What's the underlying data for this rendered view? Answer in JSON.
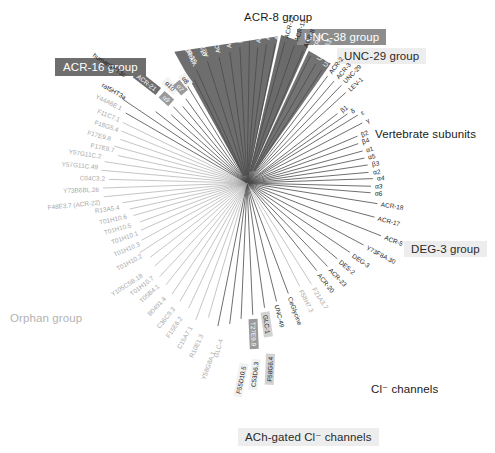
{
  "figure": {
    "type": "radial-phylogenetic-tree",
    "center": [
      247,
      183
    ]
  },
  "group_boxes": [
    {
      "name": "acr16-group",
      "label": "ACR-16 group",
      "style": "dark",
      "x": 55,
      "y": 58
    },
    {
      "name": "acr8-group",
      "label": "ACR-8 group",
      "style": "plain",
      "x": 244,
      "y": 11
    },
    {
      "name": "unc38-group",
      "label": "UNC-38 group",
      "style": "mid",
      "x": 297,
      "y": 29
    },
    {
      "name": "unc29-group",
      "label": "UNC-29 group",
      "style": "pale",
      "x": 337,
      "y": 48
    },
    {
      "name": "vertebrate-subunits",
      "label": "Vertebrate subunits",
      "style": "plain",
      "x": 375,
      "y": 128
    },
    {
      "name": "deg3-group",
      "label": "DEG-3 group",
      "style": "pale",
      "x": 404,
      "y": 241
    },
    {
      "name": "cl-channels",
      "label": "Cl⁻ channels",
      "style": "plain",
      "x": 371,
      "y": 382
    },
    {
      "name": "ach-gated-cl-channels",
      "label": "ACh-gated Cl⁻ channels",
      "style": "pale",
      "x": 238,
      "y": 428
    },
    {
      "name": "orphan-group",
      "label": "Orphan group",
      "style": "faint",
      "x": 10,
      "y": 312
    }
  ],
  "leaves": [
    {
      "text": "Y39B6BL.42",
      "angle": -114,
      "r": 128,
      "style": "white",
      "badge": "none"
    },
    {
      "text": "ACR-15",
      "angle": -108,
      "r": 132,
      "style": "white",
      "badge": "none"
    },
    {
      "text": "ACR-10",
      "angle": -102.5,
      "r": 133,
      "style": "white",
      "badge": "none"
    },
    {
      "text": "ACR-7",
      "angle": -97.5,
      "r": 136,
      "style": "white",
      "badge": "none"
    },
    {
      "text": "EAT-2",
      "angle": -93,
      "r": 140,
      "style": "white",
      "badge": "none"
    },
    {
      "text": "ACR-14",
      "angle": -89,
      "r": 146,
      "style": "white",
      "badge": "none"
    },
    {
      "text": "ACR-16",
      "angle": -85.5,
      "r": 140,
      "style": "white",
      "badge": "none"
    },
    {
      "text": "ACR-11",
      "angle": -82,
      "r": 144,
      "style": "white",
      "badge": "none"
    },
    {
      "text": "ACR-9",
      "angle": -78.5,
      "r": 146,
      "style": "white",
      "badge": "none"
    },
    {
      "text": "ACR-12",
      "angle": -75,
      "r": 150,
      "style": "dark",
      "badge": "none"
    },
    {
      "text": "ACR-13",
      "angle": -71,
      "r": 150,
      "style": "dark",
      "badge": "none"
    },
    {
      "text": "ACR-8",
      "angle": -67,
      "r": 148,
      "style": "dark",
      "badge": "none"
    },
    {
      "text": "ACR-6",
      "angle": -63.5,
      "r": 146,
      "style": "white",
      "badge": "none"
    },
    {
      "text": "UNC-63",
      "angle": -60,
      "r": 142,
      "style": "white",
      "badge": "none"
    },
    {
      "text": "UNC-38",
      "angle": -56.5,
      "r": 140,
      "style": "white",
      "badge": "none"
    },
    {
      "text": "ACR-2",
      "angle": -53,
      "r": 138,
      "style": "dark",
      "badge": "none"
    },
    {
      "text": "ACR-3",
      "angle": -49.5,
      "r": 138,
      "style": "dark",
      "badge": "none"
    },
    {
      "text": "UNC-29",
      "angle": -46,
      "r": 140,
      "style": "dark",
      "badge": "none"
    },
    {
      "text": "LEV-1",
      "angle": -42.5,
      "r": 138,
      "style": "dark",
      "badge": "none"
    },
    {
      "text": "β1",
      "angle": -37.5,
      "r": 118,
      "style": "sub",
      "badge": "none"
    },
    {
      "text": "δ",
      "angle": -34.5,
      "r": 126,
      "style": "sub",
      "badge": "none"
    },
    {
      "text": "ε",
      "angle": -31.5,
      "r": 134,
      "style": "sub",
      "badge": "none"
    },
    {
      "text": "γ",
      "angle": -27.5,
      "r": 134,
      "style": "sub",
      "badge": "none"
    },
    {
      "text": "β2",
      "angle": -23,
      "r": 124,
      "style": "sub",
      "badge": "none"
    },
    {
      "text": "β4",
      "angle": -19.5,
      "r": 122,
      "style": "sub",
      "badge": "none"
    },
    {
      "text": "α1",
      "angle": -15.5,
      "r": 124,
      "style": "sub",
      "badge": "none"
    },
    {
      "text": "α5",
      "angle": -12,
      "r": 124,
      "style": "sub",
      "badge": "none"
    },
    {
      "text": "β3",
      "angle": -8.5,
      "r": 126,
      "style": "sub",
      "badge": "none"
    },
    {
      "text": "α2",
      "angle": -5,
      "r": 126,
      "style": "sub",
      "badge": "none"
    },
    {
      "text": "α4",
      "angle": -2,
      "r": 130,
      "style": "sub",
      "badge": "none"
    },
    {
      "text": "α3",
      "angle": 1.5,
      "r": 128,
      "style": "sub",
      "badge": "none"
    },
    {
      "text": "α6",
      "angle": 4.5,
      "r": 128,
      "style": "sub",
      "badge": "none"
    },
    {
      "text": "ACR-18",
      "angle": 9,
      "r": 136,
      "style": "plain",
      "badge": "none"
    },
    {
      "text": "ACR-17",
      "angle": 15,
      "r": 136,
      "style": "plain",
      "badge": "none"
    },
    {
      "text": "ACR-5",
      "angle": 21.5,
      "r": 148,
      "style": "plain",
      "badge": "none"
    },
    {
      "text": "Y73F8A.30",
      "angle": 28,
      "r": 136,
      "style": "plain",
      "badge": "none"
    },
    {
      "text": "DEG-3",
      "angle": 34,
      "r": 128,
      "style": "plain",
      "badge": "none"
    },
    {
      "text": "DES-2",
      "angle": 40,
      "r": 122,
      "style": "plain",
      "badge": "none"
    },
    {
      "text": "ACR-23",
      "angle": 46,
      "r": 120,
      "style": "plain",
      "badge": "none"
    },
    {
      "text": "ACR-20",
      "angle": 51.5,
      "r": 116,
      "style": "plain",
      "badge": "none"
    },
    {
      "text": "F21A3.7",
      "angle": 57.5,
      "r": 124,
      "style": "gray",
      "badge": "none"
    },
    {
      "text": "F58H7.3",
      "angle": 63,
      "r": 120,
      "style": "gray",
      "badge": "none"
    },
    {
      "text": "CeGlycine",
      "angle": 69.5,
      "r": 122,
      "style": "plain",
      "badge": "none"
    },
    {
      "text": "UNC-49",
      "angle": 76,
      "r": 126,
      "style": "plain",
      "badge": "none"
    },
    {
      "text": "GLC-1",
      "angle": 82,
      "r": 130,
      "style": "badge-l",
      "badge": "light"
    },
    {
      "text": "T27E9.9",
      "angle": 87.5,
      "r": 136,
      "style": "badge-m",
      "badge": "mid"
    },
    {
      "text": "F58G6.4",
      "angle": 92.5,
      "r": 140,
      "style": "badge-l",
      "badge": "light"
    },
    {
      "text": "C53D6.3",
      "angle": 97,
      "r": 146,
      "style": "badge-w",
      "badge": "wash"
    },
    {
      "text": "F55D10.5",
      "angle": 101.5,
      "r": 150,
      "style": "badge-w",
      "badge": "wash"
    },
    {
      "text": "GLC-4",
      "angle": 106,
      "r": 144,
      "style": "gray",
      "badge": "none"
    },
    {
      "text": "Y58G8A.1",
      "angle": 110.5,
      "r": 150,
      "style": "gray",
      "badge": "none"
    },
    {
      "text": "R10E1.3",
      "angle": 115,
      "r": 142,
      "style": "gray",
      "badge": "none"
    },
    {
      "text": "C15A7.1",
      "angle": 119.5,
      "r": 140,
      "style": "gray",
      "badge": "none"
    },
    {
      "text": "F15E6.2",
      "angle": 124,
      "r": 138,
      "style": "gray",
      "badge": "none"
    },
    {
      "text": "C36C9.3",
      "angle": 128.5,
      "r": 134,
      "style": "gray",
      "badge": "none"
    },
    {
      "text": "B0491.4",
      "angle": 133,
      "r": 132,
      "style": "gray",
      "badge": "none"
    },
    {
      "text": "T05B4.1",
      "angle": 138,
      "r": 128,
      "style": "gray",
      "badge": "none"
    },
    {
      "text": "T01H10.7",
      "angle": 142.5,
      "r": 126,
      "style": "gray",
      "badge": "none"
    },
    {
      "text": "Y105C5B.18",
      "angle": 147,
      "r": 132,
      "style": "gray",
      "badge": "none"
    },
    {
      "text": "T01H10.2",
      "angle": 151.5,
      "r": 124,
      "style": "gray",
      "badge": "none"
    },
    {
      "text": "T01H10.3",
      "angle": 156,
      "r": 120,
      "style": "gray",
      "badge": "none"
    },
    {
      "text": "T01H10.1",
      "angle": 160,
      "r": 118,
      "style": "gray",
      "badge": "none"
    },
    {
      "text": "T01H10.5",
      "angle": 164,
      "r": 122,
      "style": "gray",
      "badge": "none"
    },
    {
      "text": "T01H10.6",
      "angle": 167.5,
      "r": 124,
      "style": "gray",
      "badge": "none"
    },
    {
      "text": "R13A5.4",
      "angle": 171,
      "r": 130,
      "style": "gray",
      "badge": "none"
    },
    {
      "text": "F48E3.7 (ACR-22)",
      "angle": 174.5,
      "r": 148,
      "style": "gray",
      "badge": "none"
    },
    {
      "text": "Y73B6BL.26",
      "angle": 178,
      "r": 148,
      "style": "gray",
      "badge": "none"
    },
    {
      "text": "C04C3.2",
      "angle": 181.5,
      "r": 142,
      "style": "gray",
      "badge": "none"
    },
    {
      "text": "Y57G11C.49",
      "angle": 185,
      "r": 150,
      "style": "gray",
      "badge": "none"
    },
    {
      "text": "Y57G11C.2",
      "angle": 188.5,
      "r": 148,
      "style": "gray",
      "badge": "none"
    },
    {
      "text": "F17E9.7",
      "angle": 192,
      "r": 136,
      "style": "gray",
      "badge": "none"
    },
    {
      "text": "F17E9.8",
      "angle": 195.5,
      "r": 142,
      "style": "gray",
      "badge": "none"
    },
    {
      "text": "F18G5.4",
      "angle": 199,
      "r": 138,
      "style": "gray",
      "badge": "none"
    },
    {
      "text": "F11C7.1",
      "angle": 202.5,
      "r": 140,
      "style": "gray",
      "badge": "none"
    },
    {
      "text": "Y44A6E.1",
      "angle": 206,
      "r": 142,
      "style": "gray",
      "badge": "none"
    },
    {
      "text": "rat5HT3a",
      "angle": 210,
      "r": 144,
      "style": "plain",
      "badge": "none"
    },
    {
      "text": "human5HT3c",
      "angle": 214,
      "r": 154,
      "style": "plain",
      "badge": "none"
    },
    {
      "text": "ACR-21",
      "angle": 218,
      "r": 120,
      "style": "badge-d",
      "badge": "dark"
    },
    {
      "text": "α9",
      "angle": 222,
      "r": 106,
      "style": "badge-m",
      "badge": "mid"
    },
    {
      "text": "α10",
      "angle": 226,
      "r": 110,
      "style": "badge-w",
      "badge": "wash"
    },
    {
      "text": "α7",
      "angle": 230,
      "r": 104,
      "style": "badge-m",
      "badge": "mid"
    },
    {
      "text": "α8",
      "angle": 234,
      "r": 108,
      "style": "badge-w",
      "badge": "wash"
    },
    {
      "text": "ACR-19",
      "angle": 238.5,
      "r": 118,
      "style": "white",
      "badge": "none"
    },
    {
      "text": "ACR-10",
      "angle": 243,
      "r": 120,
      "style": "white",
      "badge": "none"
    }
  ],
  "colors": {
    "branch": "#4a4a4a",
    "branch_light": "#9e9e9e",
    "group_dark": "#6e6e6e",
    "group_mid": "#8d8d8d",
    "group_pale": "#ededed",
    "background": "#ffffff"
  }
}
